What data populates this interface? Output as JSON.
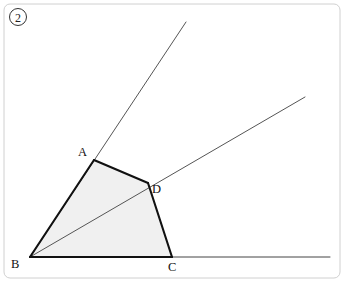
{
  "figure": {
    "problem_number": "2",
    "frame": {
      "x": 4,
      "y": 4,
      "width": 336,
      "height": 274,
      "radius": 6,
      "stroke": "#d0d0d0"
    },
    "colors": {
      "fill": "#f0f0f0",
      "edge": "#111111",
      "ray": "#555555",
      "frame": "#d0d0d0"
    },
    "points": {
      "A": {
        "x": 94,
        "y": 160,
        "label": "A",
        "label_x": 78,
        "label_y": 156
      },
      "B": {
        "x": 30,
        "y": 257,
        "label": "B",
        "label_x": 11,
        "label_y": 268
      },
      "C": {
        "x": 172,
        "y": 257,
        "label": "C",
        "label_x": 168,
        "label_y": 271
      },
      "D": {
        "x": 148,
        "y": 183,
        "label": "D",
        "label_x": 152,
        "label_y": 193
      }
    },
    "quadrilateral": {
      "name": "ABDC",
      "path": "M 30 257 L 94 160 L 148 183 L 172 257 Z",
      "edges": [
        "BA",
        "AD",
        "DC",
        "CB"
      ]
    },
    "rays": [
      {
        "name": "ray-B-through-A",
        "x1": 30,
        "y1": 257,
        "x2": 186,
        "y2": 22
      },
      {
        "name": "ray-B-through-D",
        "x1": 30,
        "y1": 257,
        "x2": 305,
        "y2": 97
      }
    ],
    "baseline": {
      "name": "baseline-BC-extended",
      "x1": 30,
      "y1": 257,
      "x2": 330,
      "y2": 257
    }
  }
}
